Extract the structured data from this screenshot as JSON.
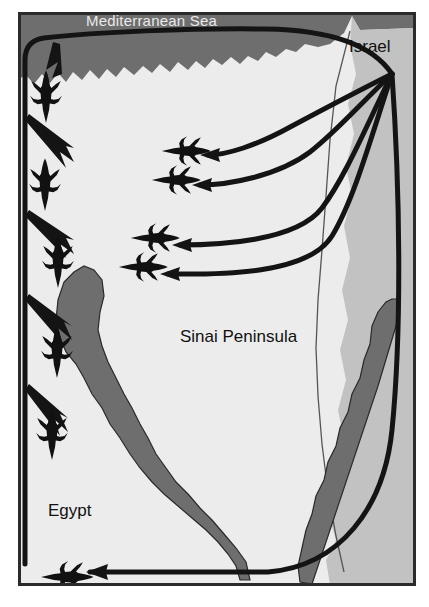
{
  "image": {
    "kind": "reference-map",
    "width": 429,
    "height": 607,
    "subject": "Air strike routes from Israel across the Sinai Peninsula into Egypt"
  },
  "frame": {
    "border_color": "#2b2b2b",
    "background_color": "#ffffff"
  },
  "palette": {
    "sea": "#6e6e6e",
    "sinai_land": "#ececec",
    "israel_land": "#c2c2c2",
    "gulf_water": "#6e6e6e",
    "route_stroke": "#141414",
    "aircraft_fill": "#111111",
    "sea_label_text": "#e9e9e9",
    "land_label_text": "#111111"
  },
  "labels": {
    "mediterranean_sea": "Mediterranean Sea",
    "israel": "Israel",
    "sinai_peninsula": "Sinai Peninsula",
    "egypt": "Egypt"
  },
  "regions": [
    {
      "name": "mediterranean-sea",
      "type": "water",
      "fill": "#6e6e6e",
      "label": "Mediterranean Sea"
    },
    {
      "name": "sinai-peninsula",
      "type": "land",
      "fill": "#ececec",
      "label": "Sinai Peninsula"
    },
    {
      "name": "israel",
      "type": "land",
      "fill": "#c2c2c2",
      "label": "Israel"
    },
    {
      "name": "egypt",
      "type": "land",
      "fill": "#ececec",
      "label": "Egypt"
    },
    {
      "name": "gulf-of-suez",
      "type": "water",
      "fill": "#6e6e6e",
      "label": ""
    },
    {
      "name": "gulf-of-aqaba",
      "type": "water",
      "fill": "#6e6e6e",
      "label": ""
    }
  ],
  "routes": {
    "count": 6,
    "origin": "Israel",
    "stroke_width": 5,
    "items": [
      {
        "id": "route-coastal-west",
        "description": "Long curve west along the Mediterranean coast then south down the Suez canal side",
        "arrow_direction": "south"
      },
      {
        "id": "route-north-inland-1",
        "description": "Curve west into northern Sinai",
        "arrow_direction": "west"
      },
      {
        "id": "route-north-inland-2",
        "description": "Curve west into north-central Sinai",
        "arrow_direction": "west"
      },
      {
        "id": "route-central-1",
        "description": "Curve west into central Sinai",
        "arrow_direction": "west"
      },
      {
        "id": "route-central-2",
        "description": "Curve west into central-south Sinai",
        "arrow_direction": "west"
      },
      {
        "id": "route-southern-loop",
        "description": "Long curve south around the Gulf of Aqaba then west across southern Egypt",
        "arrow_direction": "west"
      }
    ]
  },
  "aircraft": {
    "count": 9,
    "symbol": "fighter-jet-silhouette",
    "items": [
      {
        "id": "jet-1",
        "x": 46,
        "y": 97,
        "heading": "south"
      },
      {
        "id": "jet-2",
        "x": 45,
        "y": 185,
        "heading": "south"
      },
      {
        "id": "jet-3",
        "x": 58,
        "y": 262,
        "heading": "south"
      },
      {
        "id": "jet-4",
        "x": 57,
        "y": 352,
        "heading": "south"
      },
      {
        "id": "jet-5",
        "x": 52,
        "y": 434,
        "heading": "south"
      },
      {
        "id": "jet-6",
        "x": 186,
        "y": 151,
        "heading": "west"
      },
      {
        "id": "jet-7",
        "x": 176,
        "y": 180,
        "heading": "west"
      },
      {
        "id": "jet-8",
        "x": 157,
        "y": 238,
        "heading": "west"
      },
      {
        "id": "jet-9",
        "x": 145,
        "y": 267,
        "heading": "west"
      },
      {
        "id": "jet-10",
        "x": 67,
        "y": 577,
        "heading": "west"
      }
    ]
  }
}
